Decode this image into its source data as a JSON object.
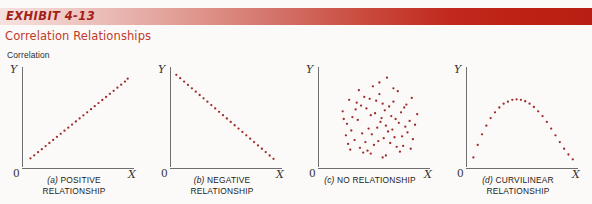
{
  "header": {
    "exhibit_label": "EXHIBIT 4-13",
    "subtitle": "Correlation Relationships",
    "bar_gradient_start": "#f7e2e0",
    "bar_gradient_end": "#b81f12",
    "subtitle_color": "#c0392b"
  },
  "section_label": "Correlation",
  "axis": {
    "y_label": "Y",
    "x_label": "X",
    "origin_label": "0",
    "axis_color": "#6e6e6e",
    "dot_color": "#9e2b2b"
  },
  "panels": [
    {
      "tag": "(a)",
      "caption_line1": "POSITIVE",
      "caption_line2": "RELATIONSHIP"
    },
    {
      "tag": "(b)",
      "caption_line1": "NEGATIVE",
      "caption_line2": "RELATIONSHIP"
    },
    {
      "tag": "(c)",
      "caption_line1": "NO RELATIONSHIP",
      "caption_line2": ""
    },
    {
      "tag": "(d)",
      "caption_line1": "CURVILINEAR",
      "caption_line2": "RELATIONSHIP"
    }
  ],
  "chart_data": [
    {
      "type": "scatter",
      "title": "(a) POSITIVE RELATIONSHIP",
      "xlabel": "X",
      "ylabel": "Y",
      "xlim": [
        0,
        100
      ],
      "ylim": [
        0,
        100
      ],
      "grid": false,
      "legend": "none",
      "marker_color": "#9e2b2b",
      "description": "Perfect positive linear trend drawn as evenly spaced dots rising left to right",
      "x": [
        6,
        9.5,
        13,
        16.5,
        20,
        23.5,
        27,
        30.5,
        34,
        37.5,
        41,
        44.5,
        48,
        51.5,
        55,
        58.5,
        62,
        65.5,
        69,
        72.5,
        76,
        79.5,
        83,
        86.5,
        90,
        93.5,
        96
      ],
      "y": [
        9,
        12.2,
        15.4,
        18.6,
        21.8,
        25,
        28.2,
        31.4,
        34.6,
        37.8,
        41,
        44.2,
        47.4,
        50.6,
        53.8,
        57,
        60.2,
        63.4,
        66.6,
        69.8,
        73,
        76.2,
        79.4,
        82.6,
        85.8,
        89,
        92
      ]
    },
    {
      "type": "scatter",
      "title": "(b) NEGATIVE RELATIONSHIP",
      "xlabel": "X",
      "ylabel": "Y",
      "xlim": [
        0,
        100
      ],
      "ylim": [
        0,
        100
      ],
      "grid": false,
      "legend": "none",
      "marker_color": "#9e2b2b",
      "description": "Perfect negative linear trend drawn as evenly spaced dots falling left to right",
      "x": [
        4,
        7.6,
        11.2,
        14.8,
        18.4,
        22,
        25.6,
        29.2,
        32.8,
        36.4,
        40,
        43.6,
        47.2,
        50.8,
        54.4,
        58,
        61.6,
        65.2,
        68.8,
        72.4,
        76,
        79.6,
        83.2,
        86.8,
        90.4,
        94
      ],
      "y": [
        96,
        92.5,
        89,
        85.5,
        82,
        78.5,
        75,
        71.5,
        68,
        64.5,
        61,
        57.5,
        54,
        50.5,
        47,
        43.5,
        40,
        36.5,
        33,
        29.5,
        26,
        22.5,
        19,
        15.5,
        12,
        8.5
      ]
    },
    {
      "type": "scatter",
      "title": "(c) NO RELATIONSHIP",
      "xlabel": "X",
      "ylabel": "Y",
      "xlim": [
        0,
        100
      ],
      "ylim": [
        0,
        100
      ],
      "grid": false,
      "legend": "none",
      "marker_color": "#9e2b2b",
      "description": "Random circular cloud of roughly 70 points with no trend, denser toward the center",
      "x": [
        62,
        36,
        49,
        72,
        85,
        27,
        55,
        68,
        41,
        78,
        33,
        58,
        46,
        90,
        21,
        64,
        52,
        75,
        38,
        83,
        30,
        60,
        47,
        70,
        25,
        88,
        43,
        56,
        66,
        79,
        35,
        51,
        61,
        73,
        29,
        45,
        57,
        81,
        39,
        67,
        24,
        53,
        63,
        76,
        32,
        48,
        59,
        86,
        42,
        69,
        26,
        54,
        65,
        77,
        37,
        50,
        71,
        84,
        44,
        28,
        40,
        74,
        80,
        34,
        47,
        61,
        55,
        22,
        68,
        58
      ],
      "y": [
        93,
        80,
        84,
        79,
        72,
        70,
        76,
        68,
        73,
        62,
        60,
        66,
        71,
        55,
        58,
        63,
        69,
        57,
        64,
        48,
        52,
        59,
        54,
        50,
        45,
        44,
        61,
        47,
        53,
        42,
        49,
        56,
        43,
        46,
        38,
        40,
        51,
        36,
        35,
        39,
        33,
        41,
        37,
        32,
        28,
        34,
        30,
        29,
        26,
        31,
        24,
        27,
        25,
        22,
        20,
        23,
        21,
        19,
        17,
        18,
        15,
        16,
        65,
        67,
        14,
        12,
        88,
        50,
        82,
        10
      ]
    },
    {
      "type": "scatter",
      "title": "(d) CURVILINEAR RELATIONSHIP",
      "xlabel": "X",
      "ylabel": "Y",
      "xlim": [
        0,
        100
      ],
      "ylim": [
        0,
        100
      ],
      "grid": false,
      "legend": "none",
      "marker_color": "#9e2b2b",
      "description": "Inverted-U parabola of dots peaking slightly left of center",
      "x": [
        5,
        9,
        13,
        17,
        21,
        25,
        29,
        33,
        37,
        41,
        45,
        49,
        53,
        57,
        61,
        65,
        69,
        73,
        77,
        81,
        85,
        89,
        93,
        97
      ],
      "y": [
        10,
        23,
        34,
        43,
        51,
        57,
        62,
        66,
        68,
        70,
        70.5,
        70,
        68.5,
        66,
        62.5,
        58,
        53,
        47,
        40,
        33,
        26,
        19,
        13,
        8
      ]
    }
  ]
}
